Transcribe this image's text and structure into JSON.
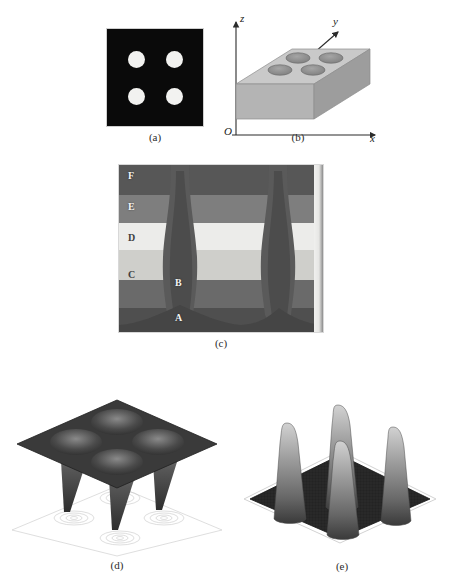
{
  "figure": {
    "panels": [
      {
        "id": "a",
        "caption": "(a)",
        "kind": "binary-mask-image",
        "description": "black square field with four white circular apertures in a 2x2 array",
        "background_color": "#0a0a0a",
        "feature_color": "#f2f2f0",
        "feature_count": 4
      },
      {
        "id": "b",
        "caption": "(b)",
        "kind": "3d-slab-schematic",
        "description": "grey rectangular slab in oblique projection with four elliptical depressions on its top face",
        "axis_labels": {
          "origin": "O",
          "x": "x",
          "y": "y",
          "z": "z"
        },
        "slab_top_color": "#c9c9c9",
        "slab_front_color": "#b0b0b0",
        "slab_side_color": "#9a9a9a",
        "hole_color": "#8f8f8f",
        "hole_count": 4
      },
      {
        "id": "c",
        "caption": "(c)",
        "kind": "grayscale-contour-map",
        "description": "cross-sectional contour bands with two deep dark valleys; levels labelled A through F",
        "level_labels": [
          "A",
          "B",
          "C",
          "D",
          "E",
          "F"
        ],
        "level_colors": [
          "#4a4a4a",
          "#5c5c5c",
          "#767676",
          "#cfcfcb",
          "#efefed",
          "#9a9a9a",
          "#6b6b6b"
        ],
        "valley_count": 2
      },
      {
        "id": "d",
        "caption": "(d)",
        "kind": "3d-surface-plot",
        "description": "dark mesh surface pierced by four downward spikes, with four faint elliptical contour ring clusters projected on the floor plane below",
        "surface_color": "#3a3a3a",
        "spike_count": 4,
        "contour_ring_count": 4,
        "orientation": "downward"
      },
      {
        "id": "e",
        "caption": "(e)",
        "kind": "3d-surface-plot",
        "description": "dark noisy base plane with four tall upward peaks rendered as speckled mesh",
        "base_color": "#232323",
        "peak_color": "#b4b4b4",
        "peak_count": 4,
        "orientation": "upward"
      }
    ]
  }
}
